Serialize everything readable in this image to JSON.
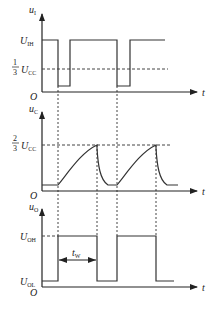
{
  "diagram": {
    "type": "timing-diagram",
    "colors": {
      "line": "#333333",
      "dashed": "#444444",
      "background": "#ffffff"
    },
    "panels": [
      {
        "id": "input",
        "y_label": "u",
        "y_label_sub": "I",
        "x_label": "t",
        "origin": "O",
        "levels": [
          {
            "label": "U",
            "sub": "IH",
            "name": "high"
          },
          {
            "label": "U",
            "sub": "CC",
            "prefix_num": "1",
            "prefix_den": "3",
            "name": "one-third-vcc"
          }
        ]
      },
      {
        "id": "capacitor",
        "y_label": "u",
        "y_label_sub": "C",
        "x_label": "t",
        "origin": "O",
        "levels": [
          {
            "label": "U",
            "sub": "CC",
            "prefix_num": "2",
            "prefix_den": "3",
            "name": "two-thirds-vcc"
          }
        ]
      },
      {
        "id": "output",
        "y_label": "u",
        "y_label_sub": "O",
        "x_label": "t",
        "origin": "O",
        "levels": [
          {
            "label": "U",
            "sub": "OH",
            "name": "output-high"
          },
          {
            "label": "U",
            "sub": "OL",
            "name": "output-low"
          }
        ],
        "pulse_width_label": "t",
        "pulse_width_sub": "W"
      }
    ]
  }
}
